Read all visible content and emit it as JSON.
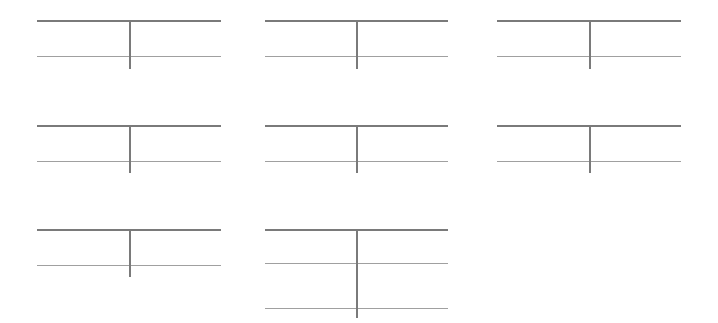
{
  "diagram": {
    "type": "t-accounts",
    "line_color": "#7a7a7a",
    "sub_line_color": "#a0a0a0",
    "accounts": [
      {
        "id": 1,
        "left": 37,
        "top": 20,
        "width": 184,
        "split": 92,
        "rows": [
          36
        ],
        "stem": 49
      },
      {
        "id": 2,
        "left": 265,
        "top": 20,
        "width": 183,
        "split": 91,
        "rows": [
          36
        ],
        "stem": 49
      },
      {
        "id": 3,
        "left": 497,
        "top": 20,
        "width": 184,
        "split": 92,
        "rows": [
          36
        ],
        "stem": 49
      },
      {
        "id": 4,
        "left": 37,
        "top": 125,
        "width": 184,
        "split": 92,
        "rows": [
          36
        ],
        "stem": 48
      },
      {
        "id": 5,
        "left": 265,
        "top": 125,
        "width": 183,
        "split": 91,
        "rows": [
          36
        ],
        "stem": 48
      },
      {
        "id": 6,
        "left": 497,
        "top": 125,
        "width": 184,
        "split": 92,
        "rows": [
          36
        ],
        "stem": 48
      },
      {
        "id": 7,
        "left": 37,
        "top": 229,
        "width": 184,
        "split": 92,
        "rows": [
          36
        ],
        "stem": 48
      },
      {
        "id": 8,
        "left": 265,
        "top": 229,
        "width": 183,
        "split": 91,
        "rows": [
          34,
          79
        ],
        "stem": 89
      }
    ]
  }
}
